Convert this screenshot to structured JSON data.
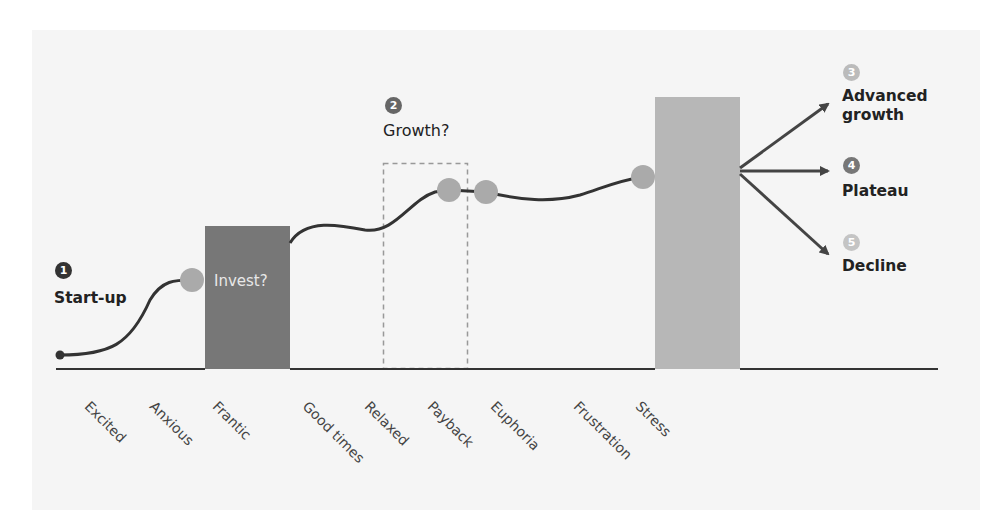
{
  "diagram": {
    "stages": [
      {
        "number": "1",
        "label": "Start-up",
        "badge_color": "#333333"
      },
      {
        "number": "2",
        "label": "Growth?",
        "badge_color": "#666666"
      },
      {
        "number": "3",
        "label_line1": "Advanced",
        "label_line2": "growth",
        "badge_color": "#bbbbbb"
      },
      {
        "number": "4",
        "label": "Plateau",
        "badge_color": "#777777"
      },
      {
        "number": "5",
        "label": "Decline",
        "badge_color": "#c4c4c4"
      }
    ],
    "boxes": {
      "invest": {
        "label": "Invest?",
        "color": "#777777"
      },
      "growth_window": {
        "style": "dashed",
        "color": "#999999"
      },
      "stress": {
        "color": "#b7b7b7"
      }
    },
    "emotions": [
      "Excited",
      "Anxious",
      "Frantic",
      "Good times",
      "Relaxed",
      "Payback",
      "Euphoria",
      "Frustration",
      "Stress"
    ],
    "colors": {
      "background_panel": "#f5f5f5",
      "curve": "#333333",
      "milestone_dot": "#aaaaaa",
      "arrow": "#444444"
    }
  }
}
